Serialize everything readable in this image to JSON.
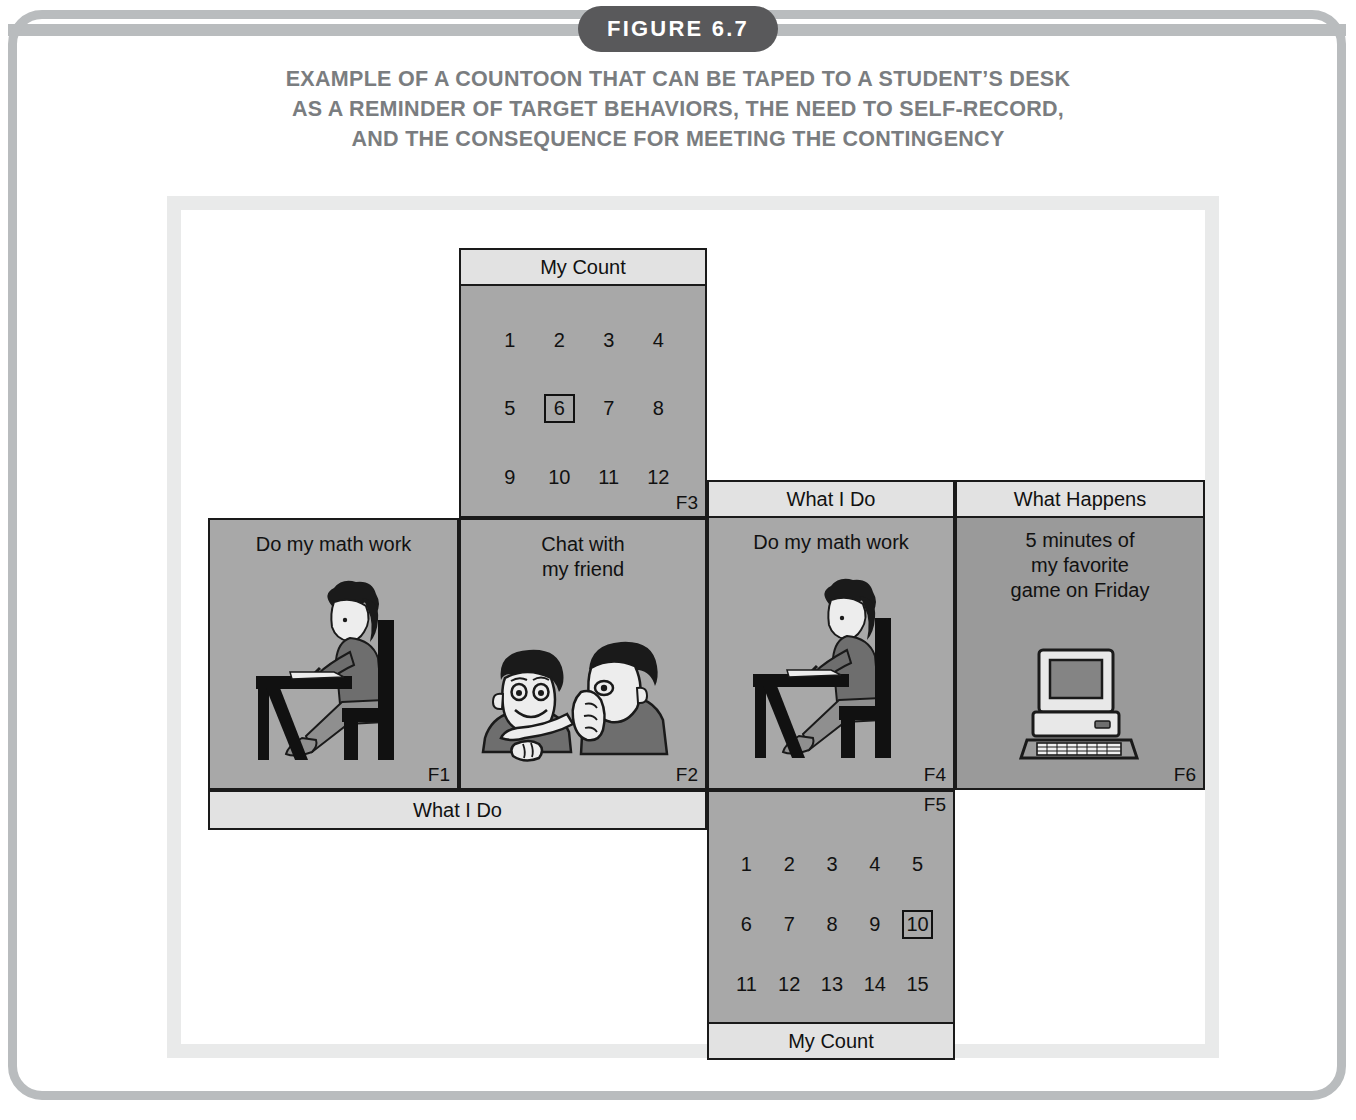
{
  "figure": {
    "badge": "FIGURE 6.7",
    "caption_lines": [
      "EXAMPLE OF A COUNTOON THAT CAN BE TAPED TO A STUDENT’S DESK",
      "AS A REMINDER OF TARGET BEHAVIORS, THE NEED TO SELF-RECORD,",
      "AND THE CONSEQUENCE FOR MEETING THE CONTINGENCY"
    ]
  },
  "colors": {
    "frame": "#b9bcbe",
    "badge_bg": "#59595b",
    "caption_text": "#7a7d80",
    "panel_fill": "#a8a8a8",
    "panel_fill_dark": "#9a9a9a",
    "band_fill": "#e2e2e2",
    "outline": "#1a1a1a",
    "figure_bg": "#e9eaea"
  },
  "countoon": {
    "panels": {
      "f3": {
        "code": "F3",
        "band_label": "My Count",
        "band_position": "top",
        "counts": [
          "1",
          "2",
          "3",
          "4",
          "5",
          "6",
          "7",
          "8",
          "9",
          "10",
          "11",
          "12"
        ],
        "boxed": "6",
        "columns": 4
      },
      "f1": {
        "code": "F1",
        "title": "Do my math work",
        "icon": "student-at-desk-icon"
      },
      "f2": {
        "code": "F2",
        "title_lines": [
          "Chat with",
          "my friend"
        ],
        "icon": "two-friends-chatting-icon"
      },
      "f4": {
        "code": "F4",
        "band_label": "What I Do",
        "band_position": "top",
        "title": "Do my math work",
        "icon": "student-at-desk-icon"
      },
      "f6": {
        "code": "F6",
        "band_label": "What Happens",
        "band_position": "top",
        "title_lines": [
          "5 minutes of",
          "my favorite",
          "game on Friday"
        ],
        "icon": "desktop-computer-icon"
      },
      "f5": {
        "code": "F5",
        "band_label": "My Count",
        "band_position": "bottom",
        "counts": [
          "1",
          "2",
          "3",
          "4",
          "5",
          "6",
          "7",
          "8",
          "9",
          "10",
          "11",
          "12",
          "13",
          "14",
          "15"
        ],
        "boxed": "10",
        "columns": 5
      }
    },
    "strips": {
      "what_i_do_bottom": "What I Do"
    }
  }
}
